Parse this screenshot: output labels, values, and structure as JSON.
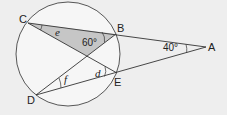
{
  "diagram": {
    "type": "circle-geometry",
    "background": "#eeeeee",
    "shade_color": "#c6c6c6",
    "line_color": "#333333",
    "circle": {
      "cx": 68,
      "cy": 54,
      "r": 52
    },
    "points": {
      "A": {
        "label": "A",
        "x": 206,
        "y": 47
      },
      "B": {
        "label": "B",
        "x": 116,
        "y": 34
      },
      "C": {
        "label": "C",
        "x": 28,
        "y": 23
      },
      "D": {
        "label": "D",
        "x": 36,
        "y": 95
      },
      "E": {
        "label": "E",
        "x": 117,
        "y": 73
      },
      "X": {
        "x": 87,
        "y": 56
      }
    },
    "segments": [
      "C-A",
      "D-A",
      "C-E",
      "B-D"
    ],
    "shaded_triangle": [
      "C",
      "B",
      "X"
    ],
    "angles": {
      "A": {
        "label": "40°"
      },
      "B": {
        "label": "60°"
      },
      "e": {
        "label": "e"
      },
      "d": {
        "label": "d"
      },
      "f": {
        "label": "f"
      }
    }
  }
}
